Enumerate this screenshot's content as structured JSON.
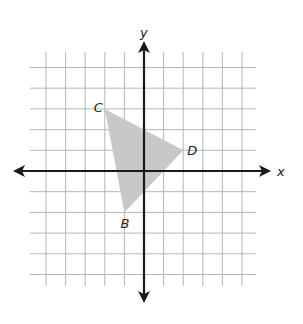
{
  "figure": {
    "type": "coordinate-plane",
    "axes": {
      "x_label": "x",
      "y_label": "y"
    },
    "grid": {
      "x_min": -5,
      "x_max": 5,
      "y_min": -5,
      "y_max": 5
    },
    "triangle": {
      "fill": "#c8c8c8",
      "vertices": [
        {
          "label": "C",
          "x": -2,
          "y": 3
        },
        {
          "label": "D",
          "x": 2,
          "y": 1
        },
        {
          "label": "B",
          "x": -1,
          "y": -2
        }
      ]
    }
  }
}
